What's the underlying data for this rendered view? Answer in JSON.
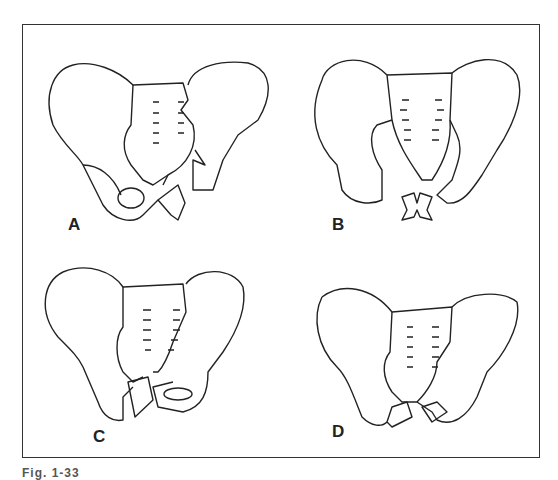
{
  "figure": {
    "caption": "Fig. 1-33",
    "panels": [
      {
        "id": "A",
        "label": "A",
        "description": "Pelvic fracture: right sacroiliac disruption with pubic rami fractures"
      },
      {
        "id": "B",
        "label": "B",
        "description": "Pelvic fracture: bilateral sacroiliac disruption with butterfly pubic fracture"
      },
      {
        "id": "C",
        "label": "C",
        "description": "Pelvic fracture: sacral fracture with ipsilateral pubic rami fractures"
      },
      {
        "id": "D",
        "label": "D",
        "description": "Pelvic fracture: bilateral pubic rami fractures"
      }
    ]
  },
  "colors": {
    "line": "#222222",
    "background": "#ffffff",
    "border": "#333333"
  }
}
